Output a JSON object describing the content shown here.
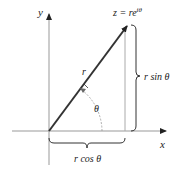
{
  "diagram": {
    "type": "polar-form-complex-number",
    "labels": {
      "y_axis": "y",
      "x_axis": "x",
      "point": "z = re",
      "point_exp": "iθ",
      "radius": "r",
      "angle": "θ",
      "vertical": "r sin θ",
      "horizontal": "r cos θ"
    },
    "colors": {
      "vector": "#333333",
      "axes": "#888888",
      "text": "#222222"
    }
  }
}
